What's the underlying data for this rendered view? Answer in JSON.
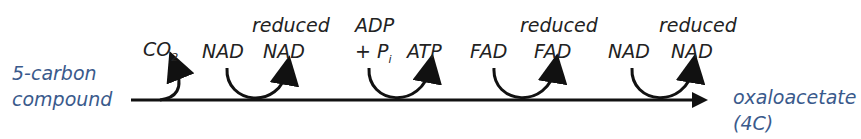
{
  "diagram": {
    "start": {
      "line1": "5-carbon",
      "line2": "compound"
    },
    "end": {
      "line1": "oxaloacetate",
      "line2": "(4C)"
    },
    "steps": [
      {
        "type": "release",
        "product": "CO",
        "product_sub": "2"
      },
      {
        "type": "reduction",
        "input": "NAD",
        "output_top": "reduced",
        "output": "NAD"
      },
      {
        "type": "phosphorylation",
        "input_top": "ADP",
        "input": "+ P",
        "input_sub": "i",
        "output": "ATP"
      },
      {
        "type": "reduction",
        "input": "FAD",
        "output_top": "reduced",
        "output": "FAD"
      },
      {
        "type": "reduction",
        "input": "NAD",
        "output_top": "reduced",
        "output": "NAD"
      }
    ],
    "colors": {
      "line": "#111111",
      "text": "#222222",
      "endpoint_text": "#3a5a8c"
    }
  }
}
